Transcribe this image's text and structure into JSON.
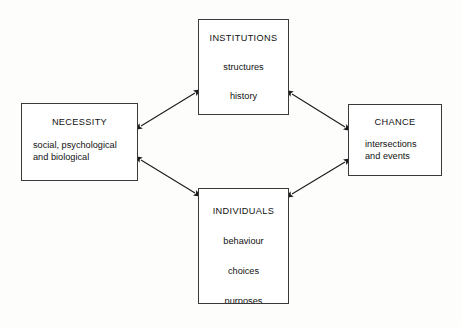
{
  "diagram": {
    "background_color": "#fdfdfc",
    "stroke_color": "#3a3a3a",
    "arrow_color": "#1a1a1a",
    "text_color": "#111111",
    "nodes": [
      {
        "id": "necessity",
        "title": "NECESSITY",
        "lines": [
          "social, psychological",
          "and biological"
        ]
      },
      {
        "id": "institutions",
        "title": "INSTITUTIONS",
        "lines": [
          "structures",
          "history"
        ]
      },
      {
        "id": "chance",
        "title": "CHANCE",
        "lines": [
          "intersections",
          "and events"
        ]
      },
      {
        "id": "individuals",
        "title": "INDIVIDUALS",
        "lines": [
          "behaviour",
          "choices",
          "purposes"
        ]
      }
    ],
    "connectors": [
      {
        "id": "necessity-institutions",
        "from": "necessity",
        "to": "institutions",
        "style": "double-headed-arrow"
      },
      {
        "id": "institutions-chance",
        "from": "institutions",
        "to": "chance",
        "style": "double-headed-arrow"
      },
      {
        "id": "necessity-individuals",
        "from": "necessity",
        "to": "individuals",
        "style": "double-headed-arrow"
      },
      {
        "id": "individuals-chance",
        "from": "individuals",
        "to": "chance",
        "style": "double-headed-arrow"
      }
    ]
  }
}
